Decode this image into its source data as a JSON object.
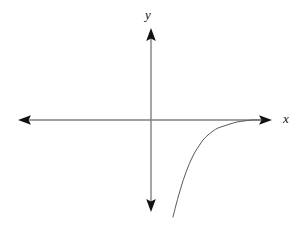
{
  "figure": {
    "width": 304,
    "height": 227,
    "background_color": "#ffffff"
  },
  "axes": {
    "origin": {
      "x": 151,
      "y": 120
    },
    "axis_color": "#808080",
    "arrowhead_color": "#111111",
    "axis_line_width": 1.4,
    "x_axis": {
      "label": "x",
      "label_position": {
        "x": 287,
        "y": 118
      },
      "left_arrow_tip": {
        "x": 18,
        "y": 120
      },
      "right_arrow_tip": {
        "x": 272,
        "y": 120
      },
      "double_headed": true
    },
    "y_axis": {
      "label": "y",
      "label_position": {
        "x": 150,
        "y": 14
      },
      "top_arrow_tip": {
        "x": 151,
        "y": 28
      },
      "bottom_arrow_tip": {
        "x": 151,
        "y": 212
      },
      "double_headed": true
    }
  },
  "chart_data": {
    "type": "line",
    "title": "",
    "subtitle": "",
    "xlabel": "x",
    "ylabel": "y",
    "grid": false,
    "legend": null,
    "legend_position": "none",
    "xlim": [
      18,
      272
    ],
    "ylim": [
      212,
      28
    ],
    "annotations": [],
    "series": [
      {
        "name": "curve",
        "description": "Logarithmic-type curve in the fourth quadrant, rising steeply from lower left and approaching the positive x-axis asymptotically from below",
        "color": "#595959",
        "line_width": 1.0,
        "asymptote": "x-axis (y = 0) from below",
        "points_px": [
          {
            "x": 173,
            "y": 217
          },
          {
            "x": 176,
            "y": 205
          },
          {
            "x": 179,
            "y": 194
          },
          {
            "x": 182,
            "y": 184
          },
          {
            "x": 185,
            "y": 175
          },
          {
            "x": 188,
            "y": 167
          },
          {
            "x": 191,
            "y": 160
          },
          {
            "x": 195,
            "y": 152
          },
          {
            "x": 199,
            "y": 146
          },
          {
            "x": 203,
            "y": 140
          },
          {
            "x": 208,
            "y": 135
          },
          {
            "x": 213,
            "y": 131
          },
          {
            "x": 218,
            "y": 128
          },
          {
            "x": 224,
            "y": 126
          },
          {
            "x": 230,
            "y": 124
          },
          {
            "x": 237,
            "y": 122
          },
          {
            "x": 244,
            "y": 121
          },
          {
            "x": 252,
            "y": 120
          },
          {
            "x": 262,
            "y": 120
          }
        ]
      }
    ]
  }
}
